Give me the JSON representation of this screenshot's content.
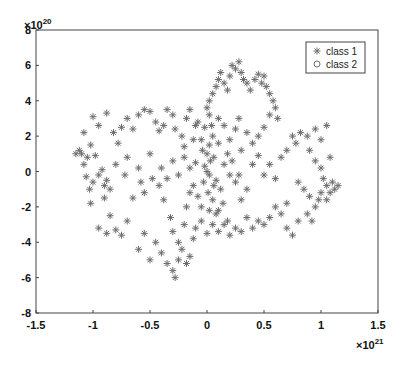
{
  "chart_data": {
    "type": "scatter",
    "title": "",
    "xlabel": "",
    "ylabel": "",
    "x_exponent_label": "×10^21",
    "y_exponent_label": "×10^20",
    "xlim": [
      -1.5,
      1.5
    ],
    "ylim": [
      -8,
      8
    ],
    "xticks": [
      "-1.5",
      "-1",
      "-0.5",
      "0",
      "0.5",
      "1",
      "1.5"
    ],
    "yticks": [
      "8",
      "6",
      "4",
      "2",
      "0",
      "-2",
      "-4",
      "-6",
      "-8"
    ],
    "grid": false,
    "legend_position": "upper right",
    "legend": [
      {
        "label": "class 1",
        "marker": "asterisk",
        "color": "#6e6e6e"
      },
      {
        "label": "class 2",
        "marker": "circle",
        "color": "#6e6e6e"
      }
    ],
    "series": [
      {
        "name": "class 1",
        "marker": "asterisk",
        "color": "#6e6e6e",
        "points": [
          [
            -1.1,
            1.0
          ],
          [
            -1.05,
            0.8
          ],
          [
            -1.08,
            0.4
          ],
          [
            -1.12,
            1.2
          ],
          [
            -1.02,
            1.5
          ],
          [
            -0.98,
            0.9
          ],
          [
            -1.06,
            -0.3
          ],
          [
            -1.0,
            -0.6
          ],
          [
            -0.95,
            -0.2
          ],
          [
            -1.03,
            -1.0
          ],
          [
            -0.92,
            0.1
          ],
          [
            -0.88,
            -0.5
          ],
          [
            -0.85,
            -1.0
          ],
          [
            -0.9,
            -0.8
          ],
          [
            -1.15,
            1.0
          ],
          [
            -1.08,
            2.2
          ],
          [
            -1.0,
            3.1
          ],
          [
            -0.95,
            2.6
          ],
          [
            -0.88,
            3.3
          ],
          [
            -0.82,
            2.2
          ],
          [
            -0.78,
            1.6
          ],
          [
            -0.75,
            2.5
          ],
          [
            -0.7,
            3.0
          ],
          [
            -0.65,
            2.4
          ],
          [
            -0.6,
            3.2
          ],
          [
            -0.55,
            3.5
          ],
          [
            -0.5,
            3.4
          ],
          [
            -0.45,
            2.8
          ],
          [
            -0.42,
            2.3
          ],
          [
            -0.38,
            2.6
          ],
          [
            -0.35,
            3.5
          ],
          [
            -0.3,
            3.2
          ],
          [
            -0.28,
            2.4
          ],
          [
            -0.22,
            2.0
          ],
          [
            -0.18,
            3.0
          ],
          [
            -0.15,
            3.5
          ],
          [
            -0.1,
            2.6
          ],
          [
            -0.05,
            1.8
          ],
          [
            -0.02,
            2.5
          ],
          [
            0.02,
            3.2
          ],
          [
            -0.9,
            -1.5
          ],
          [
            -0.85,
            -2.5
          ],
          [
            -0.8,
            -3.3
          ],
          [
            -0.75,
            -3.6
          ],
          [
            -0.88,
            -3.5
          ],
          [
            -0.95,
            -3.2
          ],
          [
            -1.02,
            -1.8
          ],
          [
            -0.7,
            -2.8
          ],
          [
            -0.65,
            -1.5
          ],
          [
            -0.58,
            -0.6
          ],
          [
            -0.55,
            -1.2
          ],
          [
            -0.48,
            -0.4
          ],
          [
            -0.42,
            -0.8
          ],
          [
            -0.38,
            -1.6
          ],
          [
            -0.32,
            -2.6
          ],
          [
            -0.3,
            -3.4
          ],
          [
            -0.25,
            -4.0
          ],
          [
            -0.2,
            -3.0
          ],
          [
            -0.18,
            -2.0
          ],
          [
            -0.15,
            -1.2
          ],
          [
            -0.45,
            -4.0
          ],
          [
            -0.4,
            -4.6
          ],
          [
            -0.35,
            -5.2
          ],
          [
            -0.3,
            -5.6
          ],
          [
            -0.28,
            -6.0
          ],
          [
            -0.25,
            -5.0
          ],
          [
            -0.22,
            -4.4
          ],
          [
            -0.18,
            -5.2
          ],
          [
            -0.15,
            -4.8
          ],
          [
            -0.12,
            -3.8
          ],
          [
            -0.55,
            -3.5
          ],
          [
            -0.6,
            -4.4
          ],
          [
            -0.5,
            -5.0
          ],
          [
            -0.1,
            -3.2
          ],
          [
            -0.05,
            -2.8
          ],
          [
            0.0,
            -3.5
          ],
          [
            0.05,
            -3.0
          ],
          [
            0.08,
            -2.4
          ],
          [
            0.1,
            -3.4
          ],
          [
            0.15,
            -3.0
          ],
          [
            0.0,
            0.0
          ],
          [
            0.02,
            -0.2
          ],
          [
            -0.02,
            0.3
          ],
          [
            0.03,
            0.6
          ],
          [
            -0.03,
            -0.6
          ],
          [
            0.01,
            -1.2
          ],
          [
            0.05,
            -1.6
          ],
          [
            -0.05,
            -2.0
          ],
          [
            0.02,
            -2.2
          ],
          [
            -0.08,
            -1.4
          ],
          [
            0.0,
            1.0
          ],
          [
            0.02,
            1.5
          ],
          [
            -0.04,
            1.2
          ],
          [
            0.06,
            0.8
          ],
          [
            -0.1,
            0.5
          ],
          [
            0.08,
            -0.5
          ],
          [
            0.12,
            -1.0
          ],
          [
            0.14,
            -1.8
          ],
          [
            0.1,
            -2.2
          ],
          [
            -0.12,
            -0.8
          ],
          [
            0.0,
            3.6
          ],
          [
            0.02,
            4.0
          ],
          [
            0.05,
            4.4
          ],
          [
            0.08,
            4.8
          ],
          [
            0.1,
            5.2
          ],
          [
            0.12,
            5.6
          ],
          [
            0.15,
            5.0
          ],
          [
            0.18,
            4.6
          ],
          [
            0.2,
            5.4
          ],
          [
            0.22,
            6.0
          ],
          [
            0.25,
            5.8
          ],
          [
            0.28,
            6.2
          ],
          [
            0.3,
            5.6
          ],
          [
            0.32,
            5.2
          ],
          [
            0.35,
            5.0
          ],
          [
            0.38,
            4.6
          ],
          [
            0.42,
            5.2
          ],
          [
            0.45,
            5.5
          ],
          [
            0.48,
            5.0
          ],
          [
            0.5,
            5.4
          ],
          [
            0.52,
            4.8
          ],
          [
            0.55,
            4.4
          ],
          [
            0.58,
            4.0
          ],
          [
            0.6,
            3.6
          ],
          [
            0.62,
            3.0
          ],
          [
            0.55,
            3.2
          ],
          [
            0.5,
            2.5
          ],
          [
            0.45,
            2.0
          ],
          [
            0.4,
            1.6
          ],
          [
            0.35,
            2.2
          ],
          [
            0.28,
            3.0
          ],
          [
            0.25,
            2.4
          ],
          [
            0.2,
            1.8
          ],
          [
            0.15,
            2.6
          ],
          [
            0.1,
            3.0
          ],
          [
            0.05,
            2.0
          ],
          [
            0.3,
            1.2
          ],
          [
            0.4,
            0.4
          ],
          [
            0.45,
            0.9
          ],
          [
            0.5,
            -0.2
          ],
          [
            0.55,
            0.4
          ],
          [
            0.6,
            -0.4
          ],
          [
            0.65,
            0.8
          ],
          [
            0.7,
            1.2
          ],
          [
            0.75,
            2.0
          ],
          [
            0.78,
            1.6
          ],
          [
            0.82,
            2.2
          ],
          [
            0.88,
            2.0
          ],
          [
            0.95,
            2.4
          ],
          [
            1.0,
            1.8
          ],
          [
            1.05,
            2.6
          ],
          [
            0.9,
            1.2
          ],
          [
            0.95,
            0.6
          ],
          [
            1.0,
            0.2
          ],
          [
            1.02,
            -0.4
          ],
          [
            1.05,
            -0.8
          ],
          [
            1.08,
            -1.2
          ],
          [
            1.1,
            -0.6
          ],
          [
            1.12,
            -1.0
          ],
          [
            1.0,
            -1.2
          ],
          [
            0.98,
            -1.6
          ],
          [
            0.95,
            -2.0
          ],
          [
            0.9,
            -1.4
          ],
          [
            0.85,
            -1.0
          ],
          [
            0.8,
            -0.6
          ],
          [
            0.88,
            -2.4
          ],
          [
            0.92,
            -2.8
          ],
          [
            1.05,
            -1.6
          ],
          [
            1.15,
            -0.8
          ],
          [
            1.08,
            0.8
          ],
          [
            0.7,
            -1.8
          ],
          [
            0.65,
            -2.4
          ],
          [
            0.6,
            -2.0
          ],
          [
            0.55,
            -2.6
          ],
          [
            0.5,
            -3.0
          ],
          [
            0.45,
            -2.8
          ],
          [
            0.4,
            -3.2
          ],
          [
            0.35,
            -2.6
          ],
          [
            0.3,
            -3.4
          ],
          [
            0.25,
            -3.2
          ],
          [
            0.2,
            -3.6
          ],
          [
            0.18,
            -2.8
          ],
          [
            0.7,
            -3.2
          ],
          [
            0.75,
            -3.6
          ],
          [
            0.8,
            -2.8
          ],
          [
            0.3,
            -1.6
          ],
          [
            0.35,
            -1.0
          ],
          [
            0.25,
            -0.6
          ],
          [
            0.2,
            -0.2
          ],
          [
            0.15,
            0.4
          ],
          [
            -0.2,
            0.8
          ],
          [
            -0.25,
            -0.2
          ],
          [
            -0.3,
            0.6
          ],
          [
            -0.35,
            -0.4
          ],
          [
            -0.4,
            0.2
          ],
          [
            -0.5,
            1.0
          ],
          [
            -0.6,
            0.2
          ],
          [
            -0.7,
            0.8
          ],
          [
            -0.72,
            -0.2
          ],
          [
            -0.8,
            0.4
          ],
          [
            -0.2,
            1.4
          ],
          [
            -0.15,
            0.2
          ],
          [
            0.18,
            1.0
          ],
          [
            0.22,
            0.6
          ],
          [
            0.28,
            -0.2
          ],
          [
            0.1,
            1.6
          ],
          [
            -0.08,
            2.8
          ],
          [
            -0.12,
            1.8
          ],
          [
            0.04,
            2.6
          ],
          [
            0.06,
            -0.8
          ]
        ]
      },
      {
        "name": "class 2",
        "marker": "circle",
        "color": "#6e6e6e",
        "points": []
      }
    ]
  }
}
